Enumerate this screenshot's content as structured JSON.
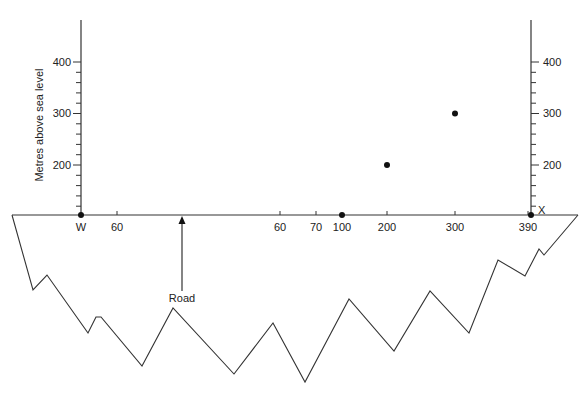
{
  "diagram": {
    "type": "cross-section-construction",
    "y_axis_title": "Metres above sea level",
    "y_ticks_left": [
      "400",
      "300",
      "200"
    ],
    "y_ticks_right": [
      "400",
      "300",
      "200"
    ],
    "x_labels": [
      {
        "text": "W",
        "x": 81
      },
      {
        "text": "60",
        "x": 117
      },
      {
        "text": "60",
        "x": 280
      },
      {
        "text": "70",
        "x": 316
      },
      {
        "text": "100",
        "x": 342
      },
      {
        "text": "200",
        "x": 387
      },
      {
        "text": "300",
        "x": 455
      },
      {
        "text": "390",
        "x": 528
      }
    ],
    "end_label": "X",
    "road_label": "Road",
    "plotted_points": [
      {
        "label": "W",
        "height_m": 100
      },
      {
        "label": "100",
        "height_m": 100
      },
      {
        "label": "200",
        "height_m": 200
      },
      {
        "label": "300",
        "height_m": 300
      },
      {
        "label": "X",
        "height_m": 100
      }
    ],
    "colors": {
      "line": "#333333",
      "text": "#222222",
      "background": "#ffffff"
    }
  }
}
